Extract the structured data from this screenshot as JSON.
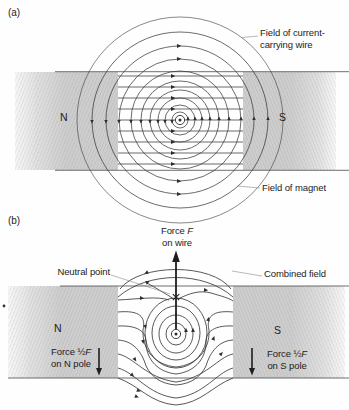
{
  "figure": {
    "panel_a": {
      "tag": "(a)",
      "pole_left": "N",
      "pole_right": "S",
      "label_wire_field_line1": "Field of current-",
      "label_wire_field_line2": "carrying wire",
      "label_magnet_field": "Field of magnet"
    },
    "panel_b": {
      "tag": "(b)",
      "pole_left": "N",
      "pole_right": "S",
      "label_force_wire_prefix": "Force ",
      "label_force_wire_symbol": "F",
      "label_force_wire_line2": "on wire",
      "label_neutral_point": "Neutral point",
      "label_combined_field": "Combined field",
      "label_force_n_prefix": "Force ½",
      "label_force_n_symbol": "F",
      "label_force_n_line2": "on N pole",
      "label_force_s_prefix": "Force ½",
      "label_force_s_symbol": "F",
      "label_force_s_line2": "on S pole"
    },
    "colors": {
      "pole_gray": "#cdcdcd",
      "field_line": "#3a3a3a",
      "text": "#1c1c1c"
    }
  }
}
